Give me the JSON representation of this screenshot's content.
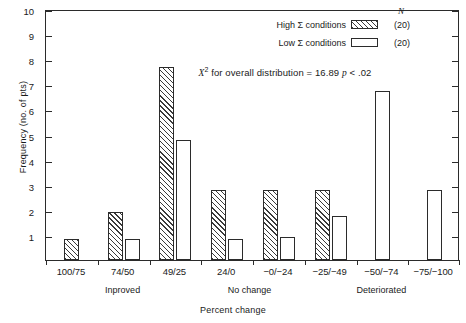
{
  "chart_data": {
    "type": "bar",
    "title": "",
    "xlabel": "Percent change",
    "ylabel": "Frequency (no. of pts)",
    "ylim": [
      0,
      10
    ],
    "yticks": [
      1,
      2,
      3,
      4,
      5,
      6,
      7,
      8,
      9,
      10
    ],
    "grid": false,
    "legend_position": "top-right",
    "categories": [
      "100/75",
      "74/50",
      "49/25",
      "24/0",
      "−0/−24",
      "−25/−49",
      "−50/−74",
      "−75/−100"
    ],
    "group_labels": [
      "Inproved",
      "No change",
      "Deteriorated"
    ],
    "series": [
      {
        "name": "High Σ conditions",
        "n": "(20)",
        "fill": "hatched",
        "values": [
          0.85,
          1.9,
          7.7,
          2.8,
          2.8,
          2.8,
          0,
          0
        ]
      },
      {
        "name": "Low Σ conditions",
        "n": "(20)",
        "fill": "open",
        "values": [
          0,
          0.85,
          4.8,
          0.85,
          0.9,
          1.75,
          6.75,
          2.8
        ]
      }
    ],
    "annotations": [
      {
        "text": "X² for overall distribution = 16.89 p < .02"
      }
    ]
  },
  "axes": {
    "y_title": "Frequency (no. of pts)",
    "x_title": "Percent change",
    "y_tick_labels": [
      "10",
      "9",
      "8",
      "7",
      "6",
      "5",
      "4",
      "3",
      "2",
      "1"
    ],
    "x_tick_labels": [
      "100/75",
      "74/50",
      "49/25",
      "24/0",
      "−0/−24",
      "−25/−49",
      "−50/−74",
      "−75/−100"
    ]
  },
  "group_labels": [
    {
      "text": "Inproved"
    },
    {
      "text": "No change"
    },
    {
      "text": "Deteriorated"
    }
  ],
  "legend": {
    "n_header": "N",
    "rows": [
      {
        "label": "High Σ conditions",
        "n": "(20)"
      },
      {
        "label": "Low Σ conditions",
        "n": "(20)"
      }
    ]
  },
  "annotation": {
    "symbol": "X",
    "superscript": "2",
    "body": " for overall distribution = 16.89 ",
    "p_symbol": "p",
    "tail": " < .02"
  },
  "colors": {
    "ink": "#2b2b2b",
    "hatch": "#3a3a3a",
    "background": "#ffffff"
  }
}
